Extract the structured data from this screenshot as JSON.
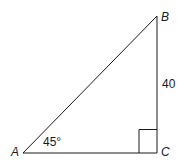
{
  "diagram": {
    "type": "right-triangle",
    "vertices": {
      "A": {
        "label": "A"
      },
      "B": {
        "label": "B"
      },
      "C": {
        "label": "C"
      }
    },
    "angle_A_label": "45°",
    "side_BC_label": "40",
    "right_angle_at": "C",
    "stroke_color": "#1a1a1a"
  }
}
